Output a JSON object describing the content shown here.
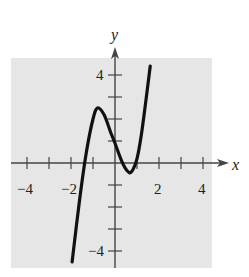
{
  "chart_data": {
    "type": "line",
    "title": "",
    "xlabel": "x",
    "ylabel": "y",
    "xlim": [
      -4.5,
      4.5
    ],
    "ylim": [
      -4.5,
      4.5
    ],
    "x_tick_labels": [
      "-4",
      "-2",
      "2",
      "4"
    ],
    "y_tick_labels": [
      "4",
      "-4"
    ],
    "grid": false,
    "series": [
      {
        "name": "curve",
        "x": [
          -1.95,
          -1.6,
          -1.3,
          -1.0,
          -0.8,
          -0.5,
          -0.2,
          0.0,
          0.3,
          0.55,
          0.75,
          1.0,
          1.2,
          1.4,
          1.6
        ],
        "y": [
          -4.5,
          -1.6,
          0.5,
          2.0,
          2.5,
          2.2,
          1.4,
          0.9,
          0.1,
          -0.35,
          -0.4,
          0.2,
          1.3,
          2.8,
          4.4
        ]
      }
    ],
    "colors": {
      "background": "#e6e6e6",
      "curve": "#111111",
      "axis": "#444444"
    }
  }
}
